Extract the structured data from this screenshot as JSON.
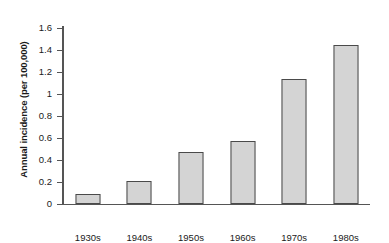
{
  "chart_data": {
    "type": "bar",
    "title": "",
    "subtitle": "",
    "xlabel": "",
    "ylabel": "Annual incidence (per 100,000)",
    "categories": [
      "1930s",
      "1940s",
      "1950s",
      "1960s",
      "1970s",
      "1980s"
    ],
    "values": [
      0.09,
      0.21,
      0.47,
      0.57,
      1.14,
      1.45
    ],
    "series": [
      {
        "name": "Annual incidence",
        "values": [
          0.09,
          0.21,
          0.47,
          0.57,
          1.14,
          1.45
        ]
      }
    ],
    "ylim": [
      0,
      1.6
    ],
    "ytick_labels": [
      "0",
      "0.2",
      "0.4",
      "0.6",
      "0.8",
      "1",
      "1.2",
      "1.4",
      "1.6"
    ],
    "ytick_values": [
      0,
      0.2,
      0.4,
      0.6,
      0.8,
      1,
      1.2,
      1.4,
      1.6
    ],
    "grid": false,
    "legend": false,
    "legend_position": "none",
    "annotations": [],
    "bar_fill_color": "#d4d4d4",
    "bar_border_color": "#4a4a4a",
    "axis_color": "#555555",
    "background_color": "#ffffff"
  }
}
